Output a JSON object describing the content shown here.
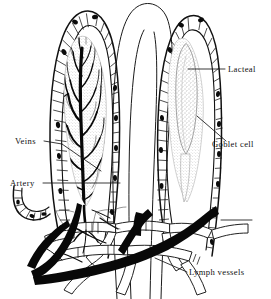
{
  "figure": {
    "background_color": "#ffffff",
    "ink_color": "#101010",
    "width": 271,
    "height": 299
  },
  "labels": [
    {
      "id": "lacteal",
      "text": "Lacteal",
      "x": 228,
      "y": 72,
      "anchor": "start",
      "leader": "M 188 69 L 225 69"
    },
    {
      "id": "goblet-cell",
      "text": "Goblet cell",
      "x": 212,
      "y": 147,
      "anchor": "start",
      "leader": "M 197 116 L 226 141"
    },
    {
      "id": "veins",
      "text": "Veins",
      "x": 15,
      "y": 144,
      "anchor": "start",
      "leader": "M 44 141 L 62 144 M 62 144 L 101 171"
    },
    {
      "id": "artery",
      "text": "Artery",
      "x": 10,
      "y": 186,
      "anchor": "start",
      "leader": "M 43 183 L 120 183"
    },
    {
      "id": "lymph-vessels",
      "text": "Lymph vessels",
      "x": 189,
      "y": 275,
      "anchor": "start",
      "leader": "M 155 258 L 187 272"
    }
  ],
  "structures": {
    "villus_left": "left villus with capillary network",
    "villus_middle": "middle villus outline",
    "villus_right": "right villus with lacteal",
    "crypt_left": "epithelial crypt fragment",
    "arteriole": "artery trunk",
    "venule": "vein trunk",
    "lymph_plexus": "submucosal lymph vessel plexus",
    "baseline_right": "right baseline tick"
  }
}
